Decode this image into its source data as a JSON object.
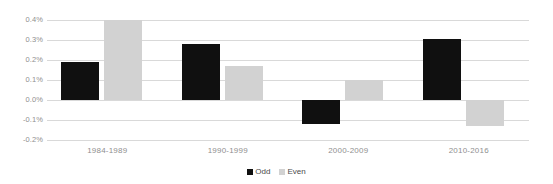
{
  "chart_data": {
    "type": "bar",
    "title": "",
    "subtitle": "",
    "xlabel": "",
    "ylabel": "",
    "categories": [
      "1984-1989",
      "1990-1999",
      "2000-2009",
      "2010-2016"
    ],
    "series": [
      {
        "name": "Odd",
        "color": "#101010",
        "values": [
          0.19,
          0.28,
          -0.12,
          0.305
        ]
      },
      {
        "name": "Even",
        "color": "#d2d2d2",
        "values": [
          0.4,
          0.17,
          0.1,
          -0.13
        ]
      }
    ],
    "ylim": [
      -0.2,
      0.4
    ],
    "ytick_values": [
      0.4,
      0.3,
      0.2,
      0.1,
      0.0,
      -0.1,
      -0.2
    ],
    "ytick_labels": [
      "0.4%",
      "0.3%",
      "0.2%",
      "0.1%",
      "0.0%",
      "-0.1%",
      "-0.2%"
    ],
    "grid": true,
    "legend_position": "bottom-center",
    "value_unit": "%"
  },
  "colors": {
    "odd": "#101010",
    "even": "#d2d2d2",
    "gridline": "#d9d9d9",
    "axis_text": "#8f8f8f",
    "legend_text": "#4a4a4a",
    "background": "#ffffff"
  }
}
